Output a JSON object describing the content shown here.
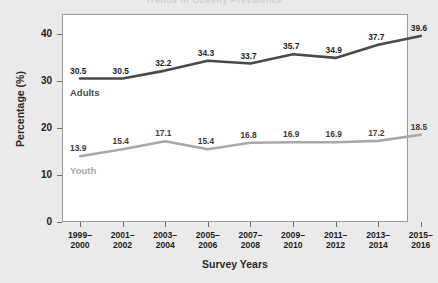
{
  "figure": {
    "title": "Trends in Obesity Prevalence",
    "background_color": "#eaeaea",
    "plot_background_color": "#ffffff"
  },
  "axis": {
    "ylabel": "Percentage (%)",
    "xlabel": "Survey Years",
    "yticks": [
      "0",
      "10",
      "20",
      "30",
      "40"
    ]
  },
  "series_labels": {
    "adults": "Adults",
    "youth": "Youth"
  },
  "chart_data": {
    "type": "line",
    "title": "Trends in Obesity Prevalence",
    "xlabel": "Survey Years",
    "ylabel": "Percentage (%)",
    "ylim": [
      0,
      42
    ],
    "yticks": [
      0,
      10,
      20,
      30,
      40
    ],
    "grid": false,
    "legend": "inline-series-labels",
    "categories": [
      "1999–2000",
      "2001–2002",
      "2003–2004",
      "2005–2006",
      "2007–2008",
      "2009–2010",
      "2011–2012",
      "2013–2014",
      "2015–2016"
    ],
    "series": [
      {
        "name": "Adults",
        "color": "#4a4a4a",
        "values": [
          30.5,
          30.5,
          32.2,
          34.3,
          33.7,
          35.7,
          34.9,
          37.7,
          39.6
        ],
        "labels": [
          "30.5",
          "30.5",
          "32.2",
          "34.3",
          "33.7",
          "35.7",
          "34.9",
          "37.7",
          "39.6"
        ]
      },
      {
        "name": "Youth",
        "color": "#a8a8a8",
        "values": [
          13.9,
          15.4,
          17.1,
          15.4,
          16.8,
          16.9,
          16.9,
          17.2,
          18.5
        ],
        "labels": [
          "13.9",
          "15.4",
          "17.1",
          "15.4",
          "16.8",
          "16.9",
          "16.9",
          "17.2",
          "18.5"
        ]
      }
    ]
  }
}
